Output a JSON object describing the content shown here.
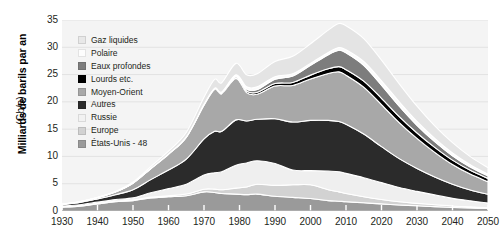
{
  "chart_data": {
    "type": "area",
    "stacked": true,
    "title": "",
    "subtitle": "",
    "xlabel": "",
    "ylabel": "Milliards de barils par an",
    "ylabel_units": "(Gb/a)",
    "xlim": [
      1930,
      2050
    ],
    "ylim": [
      0,
      35
    ],
    "xticks": [
      1930,
      1940,
      1950,
      1960,
      1970,
      1980,
      1990,
      2000,
      2010,
      2020,
      2030,
      2040,
      2050
    ],
    "yticks": [
      0,
      5,
      10,
      15,
      20,
      25,
      30,
      35
    ],
    "grid": true,
    "legend_position": "inside-top-left",
    "x": [
      1930,
      1935,
      1940,
      1945,
      1950,
      1955,
      1960,
      1965,
      1970,
      1973,
      1975,
      1979,
      1982,
      1985,
      1990,
      1995,
      2000,
      2005,
      2008,
      2010,
      2015,
      2020,
      2025,
      2030,
      2035,
      2040,
      2045,
      2050
    ],
    "series": [
      {
        "name": "États-Unis - 48",
        "color": "#9a9a9a",
        "stack_order": 9,
        "values": [
          0.7,
          0.9,
          1.3,
          1.7,
          1.9,
          2.4,
          2.6,
          2.8,
          3.5,
          3.4,
          3.2,
          3.1,
          3.0,
          3.1,
          2.7,
          2.5,
          2.3,
          1.9,
          1.8,
          1.7,
          1.5,
          1.3,
          1.1,
          0.95,
          0.8,
          0.65,
          0.55,
          0.45
        ]
      },
      {
        "name": "Europe",
        "color": "#d2d2d2",
        "stack_order": 8,
        "values": [
          0.05,
          0.05,
          0.07,
          0.08,
          0.1,
          0.15,
          0.2,
          0.3,
          0.5,
          0.6,
          0.7,
          1.1,
          1.4,
          1.8,
          2.0,
          2.3,
          2.5,
          2.0,
          1.7,
          1.5,
          1.1,
          0.8,
          0.6,
          0.45,
          0.35,
          0.27,
          0.21,
          0.16
        ]
      },
      {
        "name": "Russie",
        "color": "#efefef",
        "stack_order": 7,
        "values": [
          0.15,
          0.2,
          0.25,
          0.3,
          0.4,
          0.8,
          1.3,
          1.8,
          2.6,
          3.0,
          3.3,
          4.2,
          4.4,
          4.3,
          4.0,
          2.7,
          2.6,
          3.4,
          3.7,
          3.7,
          3.5,
          3.1,
          2.6,
          2.2,
          1.8,
          1.4,
          1.1,
          0.85
        ]
      },
      {
        "name": "Autres",
        "color": "#2b2b2b",
        "stack_order": 6,
        "values": [
          0.25,
          0.4,
          0.6,
          0.9,
          1.5,
          2.4,
          3.4,
          4.6,
          6.6,
          7.6,
          7.4,
          8.3,
          7.7,
          7.6,
          8.2,
          8.8,
          9.2,
          9.3,
          9.2,
          9.0,
          8.0,
          6.6,
          5.3,
          4.2,
          3.3,
          2.6,
          2.0,
          1.6
        ]
      },
      {
        "name": "Moyen-Orient",
        "color": "#a8a8a8",
        "stack_order": 5,
        "values": [
          0.1,
          0.15,
          0.25,
          0.5,
          1.2,
          2.0,
          2.9,
          4.0,
          6.2,
          7.7,
          6.9,
          7.6,
          5.2,
          4.6,
          6.0,
          6.7,
          7.6,
          8.6,
          9.1,
          9.0,
          8.6,
          7.7,
          6.6,
          5.5,
          4.5,
          3.6,
          2.9,
          2.3
        ]
      },
      {
        "name": "Lourds etc.",
        "color": "#000000",
        "stack_order": 4,
        "values": [
          0.0,
          0.0,
          0.0,
          0.0,
          0.02,
          0.04,
          0.06,
          0.08,
          0.12,
          0.15,
          0.18,
          0.25,
          0.3,
          0.35,
          0.45,
          0.55,
          0.7,
          0.85,
          0.95,
          1.0,
          1.1,
          1.15,
          1.1,
          1.0,
          0.9,
          0.8,
          0.7,
          0.6
        ]
      },
      {
        "name": "Eaux profondes",
        "color": "#7d7d7d",
        "stack_order": 3,
        "values": [
          0.0,
          0.0,
          0.0,
          0.0,
          0.0,
          0.0,
          0.0,
          0.0,
          0.02,
          0.05,
          0.08,
          0.2,
          0.35,
          0.5,
          0.8,
          1.2,
          1.8,
          2.6,
          3.0,
          3.1,
          2.9,
          2.4,
          1.9,
          1.4,
          1.05,
          0.8,
          0.6,
          0.45
        ]
      },
      {
        "name": "Polaire",
        "color": "#fbfbfb",
        "stack_order": 2,
        "values": [
          0.0,
          0.0,
          0.0,
          0.0,
          0.0,
          0.0,
          0.0,
          0.0,
          0.0,
          0.02,
          0.05,
          0.2,
          0.4,
          0.5,
          0.45,
          0.4,
          0.35,
          0.4,
          0.5,
          0.55,
          0.7,
          0.8,
          0.8,
          0.7,
          0.6,
          0.5,
          0.4,
          0.32
        ]
      },
      {
        "name": "Gaz liquides",
        "color": "#e4e4e4",
        "stack_order": 1,
        "values": [
          0.02,
          0.03,
          0.05,
          0.1,
          0.2,
          0.35,
          0.5,
          0.8,
          1.3,
          1.6,
          1.7,
          2.1,
          2.2,
          2.4,
          2.8,
          3.2,
          3.6,
          4.1,
          4.4,
          4.4,
          4.2,
          3.8,
          3.3,
          2.8,
          2.3,
          1.9,
          1.5,
          1.2
        ]
      }
    ],
    "totals": [
      1.27,
      1.73,
      2.52,
      3.58,
      5.32,
      8.14,
      10.96,
      14.38,
      20.84,
      24.12,
      23.51,
      27.05,
      24.95,
      25.15,
      27.4,
      28.35,
      30.65,
      33.15,
      34.35,
      33.95,
      31.6,
      27.65,
      23.31,
      19.2,
      15.6,
      12.52,
      9.96,
      7.93
    ]
  },
  "axes": {
    "ylabel_main": "Milliards de barils par an",
    "ylabel_units": "(Gb/a)",
    "yticks": [
      "35",
      "30",
      "25",
      "20",
      "15",
      "10",
      "5",
      "0"
    ],
    "xticks": [
      "1930",
      "1940",
      "1950",
      "1960",
      "1970",
      "1980",
      "1990",
      "2000",
      "2010",
      "2020",
      "2030",
      "2040",
      "2050"
    ]
  },
  "legend": {
    "items": [
      {
        "label": "Gaz liquides",
        "color": "#e8e8e8"
      },
      {
        "label": "Polaire",
        "color": "#fdfdfd"
      },
      {
        "label": "Eaux profondes",
        "color": "#7d7d7d"
      },
      {
        "label": "Lourds etc.",
        "color": "#000000"
      },
      {
        "label": "Moyen-Orient",
        "color": "#a8a8a8"
      },
      {
        "label": "Autres",
        "color": "#2b2b2b"
      },
      {
        "label": "Russie",
        "color": "#f2f2f2"
      },
      {
        "label": "Europe",
        "color": "#d2d2d2"
      },
      {
        "label": "États-Unis - 48",
        "color": "#9a9a9a"
      }
    ]
  },
  "style": {
    "plot_background": "#f4f4f4",
    "gridline_color": "#e2e2e2",
    "tick_color": "#231f20"
  }
}
